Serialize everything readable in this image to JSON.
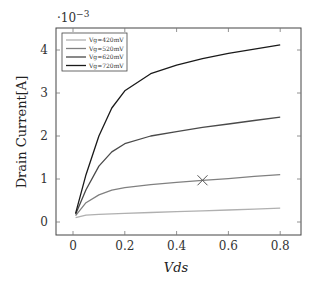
{
  "chart_data": {
    "type": "line",
    "title": "",
    "xlabel": "Vds",
    "ylabel": "Drain Current[A]",
    "y_multiplier": "·10^-3",
    "y_multiplier_base": "·10",
    "y_multiplier_exp": "−3",
    "xlim": [
      -0.04,
      0.86
    ],
    "ylim": [
      -0.3,
      4.5
    ],
    "xticks": [
      "0",
      "0.2",
      "0.4",
      "0.6",
      "0.8"
    ],
    "yticks": [
      "0",
      "1",
      "2",
      "3",
      "4"
    ],
    "grid": false,
    "legend_position": "upper left",
    "x": [
      0.01,
      0.05,
      0.1,
      0.15,
      0.2,
      0.3,
      0.4,
      0.5,
      0.6,
      0.7,
      0.8
    ],
    "series": [
      {
        "name": "Vg=420mV",
        "color": "#b0b0b0",
        "values": [
          0.1,
          0.16,
          0.18,
          0.19,
          0.2,
          0.22,
          0.24,
          0.26,
          0.28,
          0.3,
          0.32
        ]
      },
      {
        "name": "Vg=520mV",
        "color": "#808080",
        "values": [
          0.15,
          0.45,
          0.63,
          0.74,
          0.8,
          0.87,
          0.92,
          0.97,
          1.01,
          1.06,
          1.1
        ]
      },
      {
        "name": "Vg=620mV",
        "color": "#4a4a4a",
        "values": [
          0.18,
          0.75,
          1.3,
          1.63,
          1.82,
          2.0,
          2.1,
          2.2,
          2.28,
          2.36,
          2.44
        ]
      },
      {
        "name": "Vg=720mV",
        "color": "#1a1a1a",
        "values": [
          0.2,
          1.1,
          2.0,
          2.65,
          3.05,
          3.45,
          3.65,
          3.8,
          3.92,
          4.02,
          4.12
        ]
      }
    ],
    "annotations": [
      {
        "type": "marker",
        "shape": "x",
        "x": 0.5,
        "y": 0.97
      }
    ]
  }
}
